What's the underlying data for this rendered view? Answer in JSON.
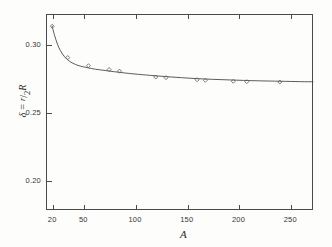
{
  "chart_data": {
    "type": "line",
    "title": "",
    "subtitle": "",
    "xlabel": "A",
    "ylabel": "δ = r/2R",
    "ylabel_parts": {
      "delta": "δ",
      "equals": "=",
      "numerator": "r",
      "slash": "/",
      "denominator": "2",
      "radius": "R"
    },
    "xlim": [
      14,
      272
    ],
    "ylim": [
      0.178,
      0.322
    ],
    "xticks": [
      20,
      50,
      100,
      150,
      200,
      250
    ],
    "xticklabels": [
      "20",
      "50",
      "100",
      "150",
      "200",
      "250"
    ],
    "yticks": [
      0.2,
      0.25,
      0.3
    ],
    "yticklabels": [
      "0.20",
      "0.25",
      "0.30"
    ],
    "grid": false,
    "legend": null,
    "marker": "open-diamond",
    "line_color": "#4a4a4a",
    "marker_color": "#5a5a5a",
    "frame_color": "#4a4a4a",
    "background_color": "#fdfdfc",
    "series": [
      {
        "name": "delta vs A",
        "x": [
          20,
          35,
          55,
          75,
          85,
          120,
          130,
          160,
          168,
          195,
          208,
          240
        ],
        "y": [
          0.313,
          0.29,
          0.284,
          0.2812,
          0.28,
          0.2757,
          0.2752,
          0.2737,
          0.2733,
          0.2726,
          0.2723,
          0.272
        ]
      }
    ],
    "curve": {
      "name": "fitted curve",
      "x": [
        20,
        22,
        25,
        28,
        32,
        36,
        40,
        45,
        50,
        55,
        62,
        70,
        80,
        90,
        100,
        115,
        130,
        145,
        160,
        175,
        190,
        205,
        220,
        240,
        260,
        272
      ],
      "y": [
        0.313,
        0.307,
        0.3,
        0.295,
        0.2905,
        0.2877,
        0.2858,
        0.2842,
        0.2832,
        0.2824,
        0.2814,
        0.2806,
        0.2796,
        0.2787,
        0.2779,
        0.2769,
        0.276,
        0.2752,
        0.2745,
        0.274,
        0.2736,
        0.2732,
        0.2729,
        0.2726,
        0.2723,
        0.2722
      ]
    }
  }
}
